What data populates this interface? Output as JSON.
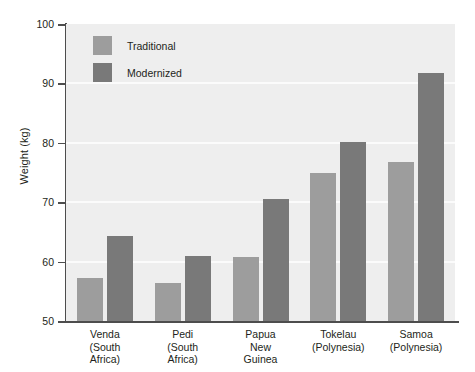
{
  "chart_data": {
    "type": "bar",
    "title": "",
    "xlabel": "",
    "ylabel": "Weight (kg)",
    "ylim": [
      50,
      100
    ],
    "yticks": [
      50,
      60,
      70,
      80,
      90,
      100
    ],
    "ytick_labels": [
      "50",
      "60",
      "70",
      "80",
      "90",
      "100"
    ],
    "grid": true,
    "grid_axis": "y",
    "legend_position": "upper left",
    "categories": [
      "Venda\n(South\nAfrica)",
      "Pedi\n(South\nAfrica)",
      "Papua\nNew\nGuinea",
      "Tokelau\n(Polynesia)",
      "Samoa\n(Polynesia)"
    ],
    "category_lines": [
      [
        "Venda",
        "(South",
        "Africa)"
      ],
      [
        "Pedi",
        "(South",
        "Africa)"
      ],
      [
        "Papua",
        "New",
        "Guinea"
      ],
      [
        "Tokelau",
        "(Polynesia)"
      ],
      [
        "Samoa",
        "(Polynesia)"
      ]
    ],
    "series": [
      {
        "name": "Traditional",
        "color": "#9d9d9d",
        "values": [
          57.2,
          56.4,
          60.8,
          75.0,
          76.7
        ]
      },
      {
        "name": "Modernized",
        "color": "#797979",
        "values": [
          64.3,
          61.0,
          70.5,
          80.1,
          91.7
        ]
      }
    ]
  },
  "legend": {
    "items": [
      {
        "label": "Traditional",
        "color": "#9d9d9d"
      },
      {
        "label": "Modernized",
        "color": "#797979"
      }
    ]
  },
  "axes": {
    "y_title": "Weight (kg)"
  },
  "colors": {
    "plot_background": "#eeeeee",
    "gridline": "#fbfbfb",
    "axis": "#4d4d4d",
    "text": "#231f20",
    "traditional": "#9d9d9d",
    "modernized": "#797979"
  }
}
